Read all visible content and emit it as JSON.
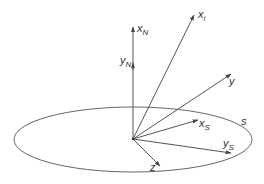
{
  "diagram": {
    "type": "3d-coordinate-vectors",
    "colors": {
      "stroke": "#555555",
      "text": "#333333",
      "background": "#ffffff"
    },
    "origin": {
      "x": 133,
      "y": 139
    },
    "surface": {
      "label": "s",
      "cx": 133,
      "cy": 139.5,
      "rx": 119,
      "ry": 32.5
    },
    "vectors": [
      {
        "id": "xN",
        "base": "x",
        "sub": "N",
        "end": [
          133,
          26
        ]
      },
      {
        "id": "yN",
        "base": "y",
        "sub": "N",
        "end": [
          133,
          63
        ]
      },
      {
        "id": "xi",
        "base": "x",
        "sub": "i",
        "end": [
          194,
          14
        ]
      },
      {
        "id": "y",
        "base": "y",
        "sub": "",
        "end": [
          231,
          73
        ]
      },
      {
        "id": "xS",
        "base": "x",
        "sub": "S",
        "end": [
          198,
          120
        ]
      },
      {
        "id": "yS",
        "base": "y",
        "sub": "S",
        "end": [
          231,
          153
        ]
      },
      {
        "id": "z",
        "base": "z",
        "sub": "",
        "end": [
          160,
          166
        ]
      }
    ]
  },
  "labels": {
    "xN": {
      "base": "x",
      "sub": "N"
    },
    "yN": {
      "base": "y",
      "sub": "N"
    },
    "xi": {
      "base": "x",
      "sub": "i"
    },
    "y": {
      "base": "y"
    },
    "xS": {
      "base": "x",
      "sub": "S"
    },
    "yS": {
      "base": "y",
      "sub": "S"
    },
    "z": {
      "base": "z"
    },
    "s": {
      "base": "s"
    }
  }
}
